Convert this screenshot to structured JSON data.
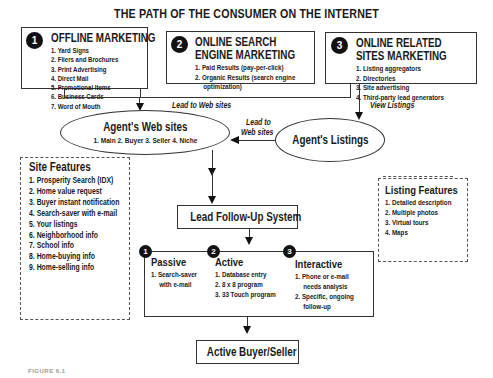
{
  "title": "THE PATH OF THE CONSUMER ON THE INTERNET",
  "sources": [
    {
      "number": "1",
      "heading_lines": [
        "OFFLINE MARKETING"
      ],
      "items": [
        "1. Yard Signs",
        "2. Fliers and Brochures",
        "3. Print Advertising",
        "4. Direct Mail",
        "5. Promotional Items",
        "6. Business Cards",
        "7. Word of Mouth"
      ]
    },
    {
      "number": "2",
      "heading_lines": [
        "ONLINE SEARCH",
        "ENGINE MARKETING"
      ],
      "items": [
        "1. Paid Results (pay-per-click)",
        "2. Organic Results (search engine",
        "optimization)"
      ]
    },
    {
      "number": "3",
      "heading_lines": [
        "ONLINE RELATED",
        "SITES MARKETING"
      ],
      "items": [
        "1. Listing aggregators",
        "2. Directories",
        "3. Site advertising",
        "4. Third-party lead generators"
      ]
    }
  ],
  "connectors": {
    "lead_to_web_sites": "Lead to Web sites",
    "view_listings": "View Listings",
    "lead_to_line1": "Lead to",
    "lead_to_line2": "Web sites"
  },
  "agents_web_sites": {
    "title": "Agent's Web sites",
    "subtitle": "1. Main  2. Buyer  3. Seller  4. Niche"
  },
  "agents_listings": {
    "title": "Agent's Listings"
  },
  "site_features": {
    "title": "Site Features",
    "items": [
      "1. Prosperity Search (IDX)",
      "2. Home value request",
      "3. Buyer instant notification",
      "4. Search-saver with e-mail",
      "5. Your listings",
      "6. Neighborhood info",
      "7. School info",
      "8. Home-buying info",
      "9. Home-selling info"
    ]
  },
  "listing_features": {
    "title": "Listing Features",
    "items": [
      "1. Detailed description",
      "2. Multiple photos",
      "3. Virtual tours",
      "4. Maps"
    ]
  },
  "lead_follow_up": {
    "title": "Lead Follow-Up System"
  },
  "follow_up_types": [
    {
      "number": "1",
      "title": "Passive",
      "items": [
        "1. Search-saver",
        "with e-mail"
      ]
    },
    {
      "number": "2",
      "title": "Active",
      "items": [
        "1. Database entry",
        "2. 8 x 8 program",
        "3. 33 Touch program"
      ]
    },
    {
      "number": "3",
      "title": "Interactive",
      "items": [
        "1. Phone or e-mail",
        "needs analysis",
        "2. Specific, ongoing",
        "follow-up"
      ]
    }
  ],
  "result": {
    "title": "Active Buyer/Seller"
  },
  "caption": "FIGURE 6.1"
}
